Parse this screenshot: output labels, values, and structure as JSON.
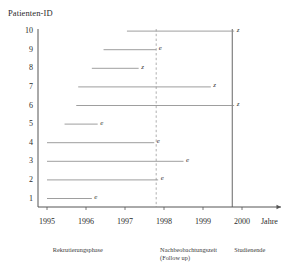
{
  "chart_data": {
    "type": "line",
    "title": "Patienten-ID",
    "ylabel": "Patienten-ID",
    "xlabel": "Jahre",
    "xlim": [
      1994.75,
      2000.9
    ],
    "ylim": [
      0.4,
      10.6
    ],
    "grid": false,
    "legend": "none",
    "xticks": [
      "1995",
      "1996",
      "1997",
      "1998",
      "1999",
      "2000"
    ],
    "xtick_values": [
      1995,
      1996,
      1997,
      1998,
      1999,
      2000
    ],
    "yticks": [
      "10",
      "9",
      "8",
      "7",
      "6",
      "5",
      "4",
      "3",
      "2",
      "1"
    ],
    "ytick_values": [
      10,
      9,
      8,
      7,
      6,
      5,
      4,
      3,
      2,
      1
    ],
    "series": [
      {
        "name": "Patient 10",
        "id": 10,
        "start": 1997.05,
        "end": 1999.8,
        "marker": "z"
      },
      {
        "name": "Patient 9",
        "id": 9,
        "start": 1996.45,
        "end": 1997.8,
        "marker": "e"
      },
      {
        "name": "Patient 8",
        "id": 8,
        "start": 1996.15,
        "end": 1997.35,
        "marker": "z"
      },
      {
        "name": "Patient 7",
        "id": 7,
        "start": 1995.8,
        "end": 1999.2,
        "marker": "z"
      },
      {
        "name": "Patient 6",
        "id": 6,
        "start": 1995.75,
        "end": 1999.8,
        "marker": "z"
      },
      {
        "name": "Patient 5",
        "id": 5,
        "start": 1995.45,
        "end": 1996.3,
        "marker": "e"
      },
      {
        "name": "Patient 4",
        "id": 4,
        "start": 1995.0,
        "end": 1997.75,
        "marker": "e"
      },
      {
        "name": "Patient 3",
        "id": 3,
        "start": 1995.0,
        "end": 1998.5,
        "marker": "e"
      },
      {
        "name": "Patient 2",
        "id": 2,
        "start": 1995.0,
        "end": 1997.85,
        "marker": "e"
      },
      {
        "name": "Patient 1",
        "id": 1,
        "start": 1995.0,
        "end": 1996.15,
        "marker": "e"
      }
    ],
    "vertical_lines": [
      {
        "name": "follow-up-start",
        "x": 1997.8,
        "style": "dashed"
      },
      {
        "name": "study-end",
        "x": 1999.75,
        "style": "solid"
      }
    ],
    "annotations": [
      {
        "name": "recruitment-phase",
        "text": "Rekrutierungsphase",
        "x": 1995.15
      },
      {
        "name": "follow-up-period",
        "text": "Nachbeobachtungszeit",
        "text2": "(Follow up)",
        "x": 1997.9
      },
      {
        "name": "study-end-label",
        "text": "Studienende",
        "x": 1999.8
      }
    ],
    "marker_legend": {
      "e": "Ereignis",
      "z": "Zensiert"
    }
  },
  "axis": {
    "y_title": "Patienten-ID",
    "x_title": "Jahre"
  },
  "colors": {
    "axis": "#555555",
    "line": "#8c8c8c",
    "dashed": "#9a9a9a",
    "text": "#2b2b2b"
  }
}
